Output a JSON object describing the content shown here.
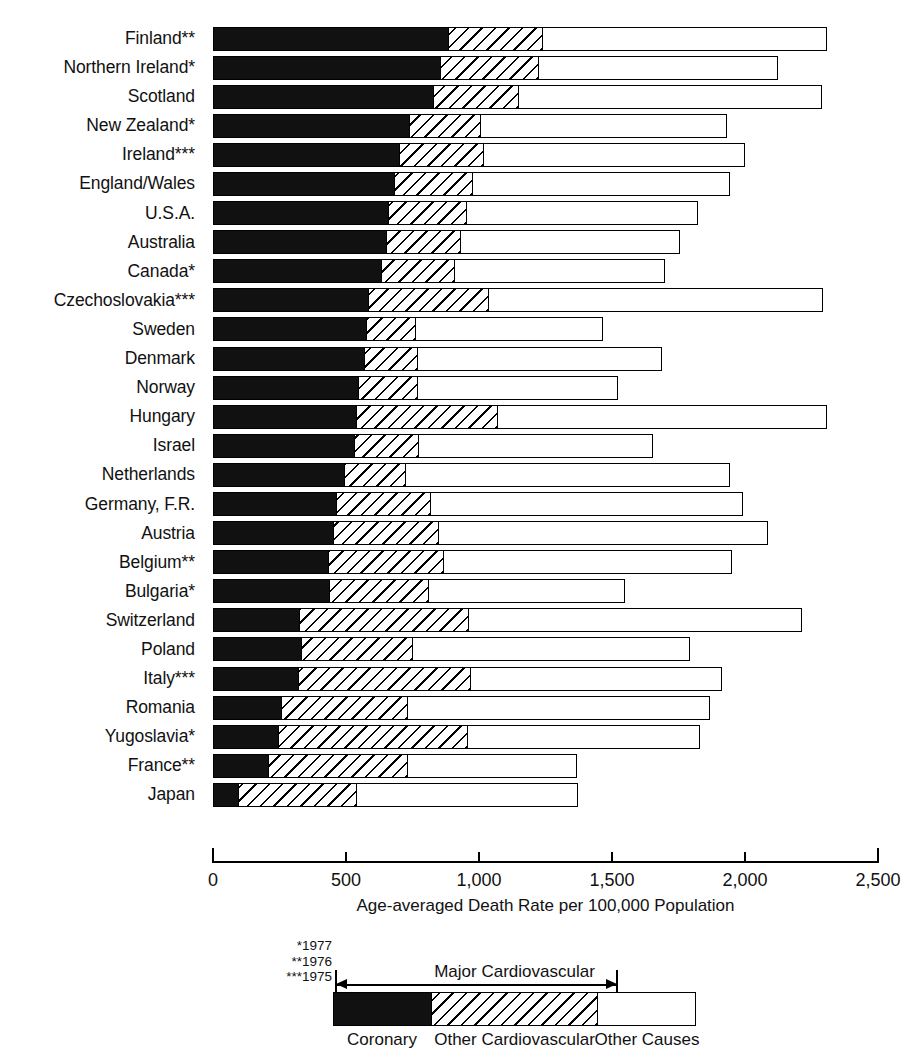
{
  "chart_data": {
    "type": "bar",
    "orientation": "horizontal",
    "stacked": true,
    "title": "",
    "xlabel": "Age-averaged Death Rate per 100,000 Population",
    "ylabel": "",
    "xlim": [
      0,
      2500
    ],
    "xticks": [
      0,
      500,
      1000,
      1500,
      2000,
      2500
    ],
    "xticklabels": [
      "0",
      "500",
      "1,000",
      "1,500",
      "2,000",
      "2,500"
    ],
    "grid": false,
    "legend_position": "bottom",
    "series": [
      {
        "name": "Coronary",
        "key": "coronary",
        "fill": "solid-black"
      },
      {
        "name": "Other Cardiovascular",
        "key": "othercv",
        "fill": "diagonal-hatch"
      },
      {
        "name": "Other Causes",
        "key": "other",
        "fill": "white"
      }
    ],
    "categories": [
      "Finland**",
      "Northern Ireland*",
      "Scotland",
      "New Zealand*",
      "Ireland***",
      "England/Wales",
      "U.S.A.",
      "Australia",
      "Canada*",
      "Czechoslovakia***",
      "Sweden",
      "Denmark",
      "Norway",
      "Hungary",
      "Israel",
      "Netherlands",
      "Germany, F.R.",
      "Austria",
      "Belgium**",
      "Bulgaria*",
      "Switzerland",
      "Poland",
      "Italy***",
      "Romania",
      "Yugoslavia*",
      "France**",
      "Japan"
    ],
    "rows": [
      {
        "country": "Finland**",
        "coronary": 880,
        "othercv": 357,
        "other": 1071,
        "total": 2308
      },
      {
        "country": "Northern Ireland*",
        "coronary": 850,
        "othercv": 372,
        "other": 902,
        "total": 2124
      },
      {
        "country": "Scotland",
        "coronary": 823,
        "othercv": 324,
        "other": 1142,
        "total": 2289
      },
      {
        "country": "New Zealand*",
        "coronary": 733,
        "othercv": 271,
        "other": 928,
        "total": 1932
      },
      {
        "country": "Ireland***",
        "coronary": 695,
        "othercv": 320,
        "other": 985,
        "total": 2000
      },
      {
        "country": "England/Wales",
        "coronary": 677,
        "othercv": 297,
        "other": 970,
        "total": 1944
      },
      {
        "country": "U.S.A.",
        "coronary": 654,
        "othercv": 296,
        "other": 874,
        "total": 1824
      },
      {
        "country": "Australia",
        "coronary": 647,
        "othercv": 283,
        "other": 826,
        "total": 1756
      },
      {
        "country": "Canada*",
        "coronary": 628,
        "othercv": 277,
        "other": 794,
        "total": 1699
      },
      {
        "country": "Czechoslovakia***",
        "coronary": 579,
        "othercv": 455,
        "other": 1259,
        "total": 2293
      },
      {
        "country": "Sweden",
        "coronary": 571,
        "othercv": 188,
        "other": 707,
        "total": 1466
      },
      {
        "country": "Denmark",
        "coronary": 564,
        "othercv": 203,
        "other": 921,
        "total": 1688
      },
      {
        "country": "Norway",
        "coronary": 541,
        "othercv": 226,
        "other": 756,
        "total": 1523
      },
      {
        "country": "Hungary",
        "coronary": 534,
        "othercv": 534,
        "other": 1240,
        "total": 2308
      },
      {
        "country": "Israel",
        "coronary": 526,
        "othercv": 245,
        "other": 883,
        "total": 1654
      },
      {
        "country": "Netherlands",
        "coronary": 489,
        "othercv": 233,
        "other": 1222,
        "total": 1944
      },
      {
        "country": "Germany, F.R.",
        "coronary": 459,
        "othercv": 357,
        "other": 1177,
        "total": 1993
      },
      {
        "country": "Austria",
        "coronary": 447,
        "othercv": 399,
        "other": 1240,
        "total": 2086
      },
      {
        "country": "Belgium**",
        "coronary": 429,
        "othercv": 436,
        "other": 1086,
        "total": 1951
      },
      {
        "country": "Bulgaria*",
        "coronary": 432,
        "othercv": 376,
        "other": 741,
        "total": 1549
      },
      {
        "country": "Switzerland",
        "coronary": 320,
        "othercv": 639,
        "other": 1255,
        "total": 2214
      },
      {
        "country": "Poland",
        "coronary": 327,
        "othercv": 421,
        "other": 1045,
        "total": 1793
      },
      {
        "country": "Italy***",
        "coronary": 316,
        "othercv": 650,
        "other": 948,
        "total": 1914
      },
      {
        "country": "Romania",
        "coronary": 252,
        "othercv": 477,
        "other": 1140,
        "total": 1869
      },
      {
        "country": "Yugoslavia*",
        "coronary": 241,
        "othercv": 714,
        "other": 876,
        "total": 1831
      },
      {
        "country": "France**",
        "coronary": 203,
        "othercv": 526,
        "other": 639,
        "total": 1368
      },
      {
        "country": "Japan",
        "coronary": 90,
        "othercv": 448,
        "other": 834,
        "total": 1372
      }
    ]
  },
  "axis": {
    "title": "Age-averaged Death Rate per 100,000 Population",
    "ticks": [
      "0",
      "500",
      "1,000",
      "1,500",
      "2,000",
      "2,500"
    ]
  },
  "footnotes": {
    "line1": "*1977",
    "line2": "**1976",
    "line3": "***1975"
  },
  "legend": {
    "brace_label": "Major Cardiovascular",
    "coronary": "Coronary",
    "othercv": "Other Cardiovascular",
    "other": "Other Causes"
  },
  "colors": {
    "ink": "#111111",
    "paper": "#ffffff"
  }
}
